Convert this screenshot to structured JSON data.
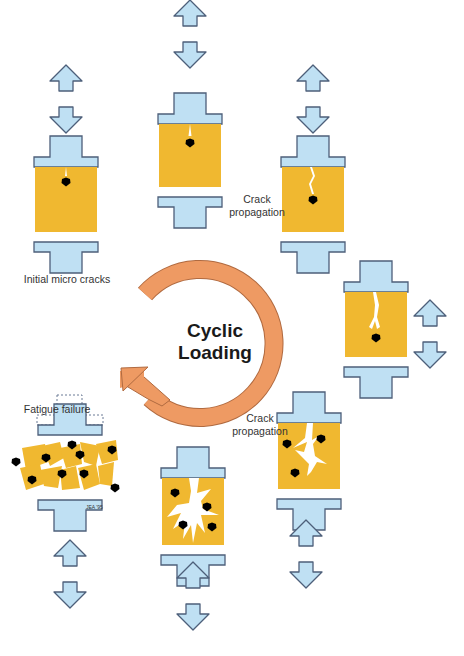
{
  "center_label_line1": "Cyclic",
  "center_label_line2": "Loading",
  "colors": {
    "grip": "#bfe0f3",
    "grip_stroke": "#4d5f7a",
    "specimen": "#f0b830",
    "crack": "#ffffff",
    "marker": "#000000",
    "cycle_arrow": "#ee9a63",
    "cycle_arrow_stroke": "#b06a40",
    "load_arrow": "#bfe0f3"
  },
  "stages": [
    {
      "id": "initial",
      "label": "Initial micro cracks",
      "crack_level": "micro",
      "marker_count": 1
    },
    {
      "id": "stage2",
      "label": "",
      "crack_level": "micro",
      "marker_count": 1
    },
    {
      "id": "stage3",
      "label": "Crack propagation",
      "crack_level": "short",
      "marker_count": 1
    },
    {
      "id": "stage4",
      "label": "",
      "crack_level": "medium",
      "marker_count": 1
    },
    {
      "id": "stage5",
      "label": "Crack propagation",
      "crack_level": "branched",
      "marker_count": 3
    },
    {
      "id": "stage6",
      "label": "",
      "crack_level": "heavily-branched",
      "marker_count": 4
    },
    {
      "id": "failure",
      "label": "Fatigue failure",
      "crack_level": "fractured",
      "marker_count": 11
    }
  ],
  "labels": {
    "initial": "Initial micro cracks",
    "crack_prop_1_line1": "Crack",
    "crack_prop_1_line2": "propagation",
    "crack_prop_2_line1": "Crack",
    "crack_prop_2_line2": "propagation",
    "fatigue": "Fatigue failure"
  },
  "credit": "JEA '95"
}
